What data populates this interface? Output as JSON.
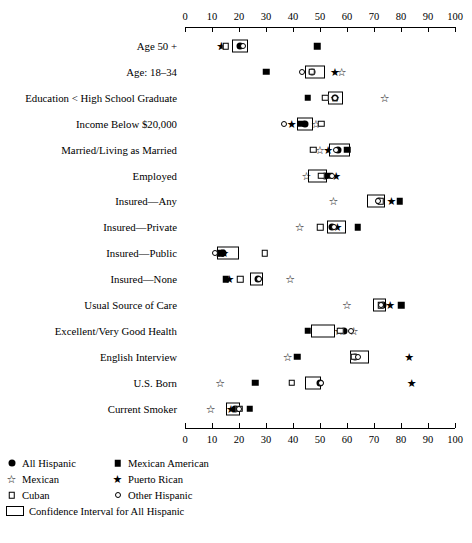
{
  "chart_data": {
    "type": "scatter",
    "title": "",
    "xlabel": "",
    "ylabel": "",
    "xlim": [
      0,
      100
    ],
    "xticks": [
      0,
      10,
      20,
      30,
      40,
      50,
      60,
      70,
      80,
      90,
      100
    ],
    "grid": false,
    "axis_top": true,
    "axis_bottom": true,
    "legend_position": "bottom-left",
    "categories": [
      "Age 50 +",
      "Age: 18–34",
      "Education  <  High School Graduate",
      "Income Below $20,000",
      "Married/Living as Married",
      "Employed",
      "Insured—Any",
      "Insured—Private",
      "Insured—Public",
      "Insured—None",
      "Usual Source of Care",
      "Excellent/Very Good Health",
      "English Interview",
      "U.S. Born",
      "Current Smoker"
    ],
    "series": [
      {
        "name": "All Hispanic",
        "symbol": "filled-circle",
        "values": [
          20.5,
          47.0,
          55.5,
          44.5,
          56.5,
          52.0,
          72.0,
          54.5,
          14.0,
          27.0,
          73.5,
          59.0,
          63.0,
          50.0,
          18.5
        ]
      },
      {
        "name": "Mexican American",
        "symbol": "filled-square",
        "values": [
          49.0,
          30.0,
          45.5,
          43.0,
          60.0,
          53.5,
          79.5,
          64.0,
          13.0,
          15.0,
          80.0,
          45.5,
          41.5,
          26.0,
          24.0
        ]
      },
      {
        "name": "Mexican",
        "symbol": "open-star",
        "values": [
          13.5,
          58.0,
          74.0,
          48.5,
          50.0,
          45.0,
          55.0,
          42.5,
          13.5,
          39.0,
          60.0,
          62.5,
          38.0,
          13.0,
          9.5
        ]
      },
      {
        "name": "Puerto Rican",
        "symbol": "filled-star",
        "values": [
          13.5,
          55.5,
          55.5,
          39.5,
          53.0,
          56.0,
          76.5,
          56.5,
          14.5,
          16.5,
          76.0,
          57.0,
          83.0,
          84.0,
          17.0
        ]
      },
      {
        "name": "Cuban",
        "symbol": "open-square",
        "values": [
          15.0,
          47.0,
          52.0,
          50.5,
          47.5,
          50.5,
          72.5,
          50.0,
          29.5,
          20.5,
          72.5,
          57.5,
          62.5,
          39.5,
          20.0
        ]
      },
      {
        "name": "Other Hispanic",
        "symbol": "open-circle",
        "values": [
          21.5,
          43.5,
          55.5,
          36.5,
          56.0,
          54.5,
          71.5,
          55.0,
          11.0,
          27.5,
          72.5,
          61.5,
          64.0,
          50.5,
          20.0
        ]
      }
    ],
    "confidence_intervals": [
      {
        "label": "All Hispanic",
        "lo": [
          17.5,
          44.5,
          53.0,
          41.5,
          53.5,
          45.5,
          67.5,
          52.5,
          12.0,
          24.0,
          69.5,
          46.5,
          61.0,
          44.5,
          15.0
        ],
        "hi": [
          23.5,
          52.0,
          58.5,
          47.5,
          61.0,
          52.5,
          74.0,
          59.5,
          20.0,
          29.0,
          74.5,
          55.5,
          68.0,
          50.5,
          20.5
        ]
      }
    ]
  },
  "legend": {
    "rows": [
      [
        {
          "symbol": "filled-circle",
          "label": "All Hispanic"
        },
        {
          "symbol": "filled-square",
          "label": "Mexican American"
        }
      ],
      [
        {
          "symbol": "open-star",
          "label": "Mexican"
        },
        {
          "symbol": "filled-star",
          "label": "Puerto Rican"
        }
      ],
      [
        {
          "symbol": "open-square",
          "label": "Cuban"
        },
        {
          "symbol": "open-circle",
          "label": "Other Hispanic"
        }
      ]
    ],
    "ci_label": "Confidence Interval for All Hispanic"
  },
  "colors": {
    "ink": "#000000",
    "paper": "#ffffff"
  }
}
